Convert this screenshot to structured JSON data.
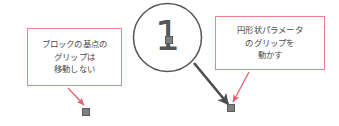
{
  "canvas": {
    "width": 339,
    "height": 126,
    "background": "#ffffff"
  },
  "colors": {
    "callout_border": "#e8838d",
    "callout_arrow": "#e8606e",
    "text": "#4a4a4a",
    "circle_stroke": "#555555",
    "grip_fill": "#7f7f7f",
    "grip_stroke": "#5d5d5d",
    "drag_arrow": "#4d4d4d"
  },
  "callouts": {
    "left": {
      "name": "block-base-point-note",
      "lines": [
        "ブロックの基点の",
        "グリップは",
        "移動しない"
      ]
    },
    "right": {
      "name": "circular-parameter-note",
      "lines": [
        "円形状パラメータ",
        "のグリップを",
        "動かす"
      ]
    }
  },
  "step_marker": {
    "label": "1"
  },
  "grips": [
    {
      "name": "block-base-point-grip",
      "label": "基点グリップ"
    },
    {
      "name": "circular-parameter-grip",
      "label": "円形状パラメータグリップ"
    },
    {
      "name": "circle-center-grip",
      "label": "中心グリップ"
    }
  ],
  "arrows": {
    "left_pointer": "ブロックの基点のグリップを指す矢印",
    "right_pointer": "円形状パラメータのグリップを指す矢印",
    "drag_direction": "ドラッグ方向矢印"
  }
}
